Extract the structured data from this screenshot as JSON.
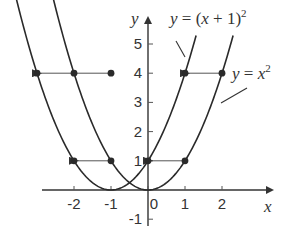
{
  "chart_data": {
    "type": "line",
    "title": "",
    "xlabel": "x",
    "ylabel": "y",
    "xlim": [
      -3,
      3.4
    ],
    "ylim": [
      -1,
      5.8
    ],
    "grid": false,
    "x_ticks": [
      -2,
      -1,
      0,
      1,
      2
    ],
    "x_tick_labels": [
      "-2",
      "-1",
      "0",
      "1",
      "2"
    ],
    "y_ticks": [
      -1,
      1,
      2,
      3,
      4,
      5
    ],
    "y_tick_labels": [
      "-1",
      "1",
      "2",
      "3",
      "4",
      "5"
    ],
    "series": [
      {
        "name": "y = x^2",
        "label": "y = x²",
        "expression": "x^2",
        "x_range": [
          -2.6,
          2.3
        ],
        "marked_points": [
          [
            2,
            4
          ],
          [
            1,
            1
          ],
          [
            0,
            0
          ]
        ]
      },
      {
        "name": "y = (x + 1)^2",
        "label": "y = (x + 1)²",
        "expression": "(x+1)^2",
        "x_range": [
          -3.6,
          1.3
        ],
        "marked_points": [
          [
            1,
            4
          ],
          [
            0,
            1
          ],
          [
            -1,
            0
          ]
        ]
      }
    ],
    "shift_arrows": [
      {
        "from": [
          2,
          4
        ],
        "to": [
          1,
          4
        ]
      },
      {
        "from": [
          1,
          1
        ],
        "to": [
          0,
          1
        ]
      },
      {
        "from": [
          -1,
          4
        ],
        "to": [
          -3,
          4
        ]
      },
      {
        "from": [
          -1,
          1
        ],
        "to": [
          -2,
          1
        ]
      }
    ],
    "points": [
      [
        -3,
        4
      ],
      [
        -2,
        4
      ],
      [
        -1,
        4
      ],
      [
        1,
        4
      ],
      [
        2,
        4
      ],
      [
        -2,
        1
      ],
      [
        -1,
        1
      ],
      [
        0,
        1
      ],
      [
        1,
        1
      ]
    ],
    "annotations": [
      {
        "text": "y = (x + 1)²",
        "points_to": "y = (x + 1)^2"
      },
      {
        "text": "y = x²",
        "points_to": "y = x^2"
      }
    ]
  },
  "labels": {
    "x_axis": "x",
    "y_axis": "y",
    "eq_shifted_prefix": "y",
    "eq_shifted_mid": " = (",
    "eq_shifted_var": "x",
    "eq_shifted_suffix": " + 1)",
    "eq_shifted_exp": "2",
    "eq_base_prefix": "y",
    "eq_base_mid": " = ",
    "eq_base_var": "x",
    "eq_base_exp": "2"
  }
}
